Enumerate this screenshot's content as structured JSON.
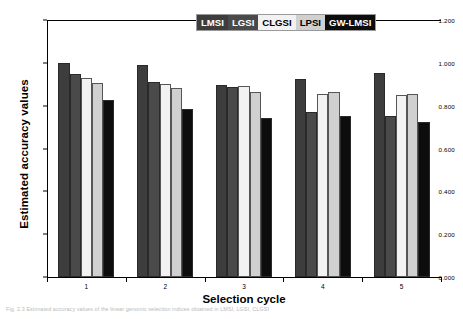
{
  "figure": {
    "background": "#ffffff",
    "caption": "Fig. 2.3   Estimated accuracy values of the linear genomic selection indices obtained in LMSI, LGSI, CLGSI"
  },
  "legend": {
    "position": "top-right",
    "items": [
      {
        "label": "LMSI",
        "bg": "#3d3d3d",
        "fg": "#ffffff"
      },
      {
        "label": "LGSI",
        "bg": "#4a4a4a",
        "fg": "#ffffff"
      },
      {
        "label": "CLGSI",
        "bg": "#f2f2f2",
        "fg": "#000000"
      },
      {
        "label": "LPSI",
        "bg": "#d0d0d0",
        "fg": "#000000"
      },
      {
        "label": "GW-LMSI",
        "bg": "#0d0d0d",
        "fg": "#ffffff"
      }
    ]
  },
  "chart_data": {
    "type": "bar",
    "title": "",
    "xlabel": "Selection cycle",
    "ylabel": "Estimated accuracy values",
    "categories": [
      "1",
      "2",
      "3",
      "4",
      "5"
    ],
    "ylim": [
      0.0,
      1.2
    ],
    "yticks": [
      "0.000",
      "0.200",
      "0.400",
      "0.600",
      "0.800",
      "1.000",
      "1.200"
    ],
    "ytick_values": [
      0.0,
      0.2,
      0.4,
      0.6,
      0.8,
      1.0,
      1.2
    ],
    "grid": false,
    "legend_position": "top-right",
    "series": [
      {
        "name": "LMSI",
        "color": "#3d3d3d",
        "values": [
          0.998,
          0.992,
          0.896,
          0.923,
          0.953
        ]
      },
      {
        "name": "LGSI",
        "color": "#4a4a4a",
        "values": [
          0.949,
          0.91,
          0.886,
          0.772,
          0.753
        ]
      },
      {
        "name": "CLGSI",
        "color": "#f2f2f2",
        "values": [
          0.927,
          0.902,
          0.89,
          0.853,
          0.849
        ]
      },
      {
        "name": "LPSI",
        "color": "#d0d0d0",
        "values": [
          0.906,
          0.883,
          0.866,
          0.864,
          0.856
        ]
      },
      {
        "name": "GW-LMSI",
        "color": "#0d0d0d",
        "values": [
          0.825,
          0.784,
          0.741,
          0.753,
          0.723
        ]
      }
    ]
  }
}
